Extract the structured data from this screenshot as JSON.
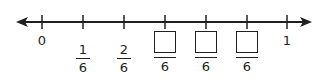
{
  "number_line": {
    "range": [
      0,
      1
    ],
    "denominator": 6,
    "arrows": "both",
    "line_color": "#231f20",
    "labels": {
      "start": "0",
      "end": "1"
    },
    "fractions": [
      {
        "position": 1,
        "numerator": "1",
        "denominator": "6",
        "blank": false
      },
      {
        "position": 2,
        "numerator": "2",
        "denominator": "6",
        "blank": false
      },
      {
        "position": 3,
        "numerator": "",
        "denominator": "6",
        "blank": true
      },
      {
        "position": 4,
        "numerator": "",
        "denominator": "6",
        "blank": true
      },
      {
        "position": 5,
        "numerator": "",
        "denominator": "6",
        "blank": true
      }
    ]
  }
}
